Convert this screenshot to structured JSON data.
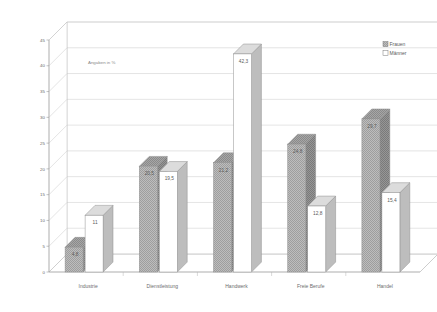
{
  "chart_data": {
    "type": "bar",
    "title": "",
    "subtitle": "",
    "annotation": "Angaben in %",
    "xlabel": "",
    "ylabel": "",
    "ylim": [
      0,
      45
    ],
    "ytick_step": 5,
    "yticks": [
      "0",
      "5",
      "10",
      "15",
      "20",
      "25",
      "30",
      "35",
      "40",
      "45"
    ],
    "grid": true,
    "legend_position": "top-right",
    "categories": [
      "Industrie",
      "Dienstleistung",
      "Handwerk",
      "Freie Berufe",
      "Handel"
    ],
    "series": [
      {
        "name": "Frauen",
        "color": "#b0b0b0",
        "values": [
          4.8,
          20.5,
          21.2,
          24.8,
          29.7
        ],
        "labels": [
          "4,8",
          "20,5",
          "21,2",
          "24,8",
          "29,7"
        ]
      },
      {
        "name": "Männer",
        "color": "#ffffff",
        "values": [
          11,
          19.5,
          42.3,
          12.8,
          15.4
        ],
        "labels": [
          "11",
          "19,5",
          "42,3",
          "12,8",
          "15,4"
        ]
      }
    ]
  },
  "legend": {
    "items": [
      {
        "label": "Frauen",
        "swatch": "hatched-gray"
      },
      {
        "label": "Männer",
        "swatch": "white"
      }
    ]
  },
  "colors": {
    "frauen_fill": "#b0b0b0",
    "frauen_top": "#8f8f8f",
    "frauen_side": "#7d7d7d",
    "manner_fill": "#ffffff",
    "manner_top": "#d8d8d8",
    "manner_side": "#b5b5b5",
    "grid": "#c9c9c9",
    "axis": "#9a9a9a",
    "text": "#6b6b6b"
  }
}
